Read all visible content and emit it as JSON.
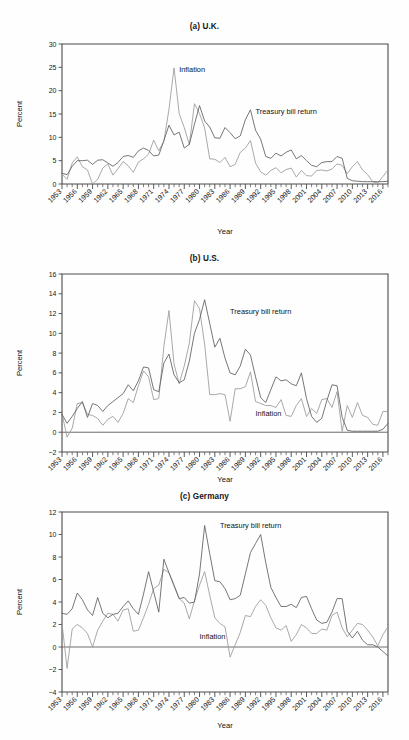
{
  "figure": {
    "axis_label_y": "Percent",
    "axis_label_x": "Year",
    "series_names": {
      "inflation": "Inflation",
      "tbill": "Treasury bill return"
    },
    "colors": {
      "inflation": "#9a9a9a",
      "tbill": "#5e5e5e",
      "axis": "#4a4a4a",
      "background": "#fefefe"
    }
  },
  "panels": [
    {
      "id": "uk",
      "title": "(a) U.K."
    },
    {
      "id": "us",
      "title": "(b) U.S."
    },
    {
      "id": "de",
      "title": "(c) Germany"
    }
  ],
  "chart_data": [
    {
      "type": "line",
      "title": "(a) U.K.",
      "xlabel": "Year",
      "ylabel": "Percent",
      "ylim": [
        0,
        30
      ],
      "yticks": [
        0,
        5,
        10,
        15,
        20,
        25,
        30
      ],
      "xlim": [
        1953,
        2017
      ],
      "xticks": [
        1953,
        1956,
        1959,
        1962,
        1965,
        1968,
        1971,
        1974,
        1977,
        1980,
        1983,
        1986,
        1989,
        1992,
        1995,
        1998,
        2001,
        2004,
        2007,
        2010,
        2013,
        2016
      ],
      "grid": false,
      "legend": "inline-annotations",
      "x": [
        1953,
        1954,
        1955,
        1956,
        1957,
        1958,
        1959,
        1960,
        1961,
        1962,
        1963,
        1964,
        1965,
        1966,
        1967,
        1968,
        1969,
        1970,
        1971,
        1972,
        1973,
        1974,
        1975,
        1976,
        1977,
        1978,
        1979,
        1980,
        1981,
        1982,
        1983,
        1984,
        1985,
        1986,
        1987,
        1988,
        1989,
        1990,
        1991,
        1992,
        1993,
        1994,
        1995,
        1996,
        1997,
        1998,
        1999,
        2000,
        2001,
        2002,
        2003,
        2004,
        2005,
        2006,
        2007,
        2008,
        2009,
        2010,
        2011,
        2012,
        2013,
        2014,
        2015,
        2016,
        2017
      ],
      "series": [
        {
          "name": "Inflation",
          "values": [
            2.1,
            1.0,
            4.5,
            5.8,
            3.7,
            3.0,
            0.0,
            1.0,
            3.4,
            4.3,
            1.9,
            3.3,
            4.8,
            3.9,
            2.5,
            4.7,
            5.4,
            6.4,
            9.4,
            7.1,
            9.2,
            16.0,
            24.9,
            15.1,
            12.1,
            8.4,
            17.2,
            15.1,
            12.0,
            5.4,
            5.3,
            4.6,
            5.7,
            3.7,
            4.2,
            6.8,
            7.7,
            9.3,
            4.5,
            2.6,
            1.9,
            2.9,
            3.5,
            2.4,
            3.1,
            3.4,
            1.5,
            2.9,
            1.8,
            1.7,
            2.9,
            3.0,
            2.8,
            3.2,
            4.3,
            4.0,
            2.2,
            3.7,
            4.8,
            3.0,
            2.0,
            0.5,
            0.2,
            1.6,
            3.0
          ],
          "color": "#9a9a9a"
        },
        {
          "name": "Treasury bill return",
          "values": [
            2.3,
            2.0,
            3.8,
            5.0,
            5.0,
            5.1,
            4.2,
            5.1,
            5.2,
            4.5,
            3.8,
            4.6,
            5.9,
            6.1,
            5.7,
            7.1,
            7.7,
            7.2,
            6.0,
            6.2,
            9.3,
            12.6,
            10.5,
            11.1,
            7.7,
            8.5,
            12.8,
            16.8,
            13.5,
            12.2,
            9.9,
            9.8,
            12.1,
            11.0,
            9.7,
            10.3,
            13.8,
            15.9,
            11.5,
            9.6,
            5.9,
            5.5,
            6.6,
            6.0,
            6.8,
            7.3,
            5.4,
            6.1,
            5.0,
            4.0,
            3.7,
            4.6,
            4.8,
            4.8,
            5.9,
            5.5,
            1.2,
            0.7,
            0.6,
            0.5,
            0.5,
            0.5,
            0.5,
            0.5,
            0.6
          ],
          "color": "#5e5e5e"
        }
      ],
      "annotations": [
        {
          "text": "Inflation",
          "x": 1976,
          "y": 24.0
        },
        {
          "text": "Treasury bill return",
          "x": 1991,
          "y": 15.0
        }
      ]
    },
    {
      "type": "line",
      "title": "(b) U.S.",
      "xlabel": "Year",
      "ylabel": "Percent",
      "ylim": [
        -2,
        16
      ],
      "yticks": [
        -2,
        0,
        2,
        4,
        6,
        8,
        10,
        12,
        14,
        16
      ],
      "xlim": [
        1953,
        2017
      ],
      "xticks": [
        1953,
        1956,
        1959,
        1962,
        1965,
        1968,
        1971,
        1974,
        1977,
        1980,
        1983,
        1986,
        1989,
        1992,
        1995,
        1998,
        2001,
        2004,
        2007,
        2010,
        2013,
        2016
      ],
      "grid": false,
      "legend": "inline-annotations",
      "x": [
        1953,
        1954,
        1955,
        1956,
        1957,
        1958,
        1959,
        1960,
        1961,
        1962,
        1963,
        1964,
        1965,
        1966,
        1967,
        1968,
        1969,
        1970,
        1971,
        1972,
        1973,
        1974,
        1975,
        1976,
        1977,
        1978,
        1979,
        1980,
        1981,
        1982,
        1983,
        1984,
        1985,
        1986,
        1987,
        1988,
        1989,
        1990,
        1991,
        1992,
        1993,
        1994,
        1995,
        1996,
        1997,
        1998,
        1999,
        2000,
        2001,
        2002,
        2003,
        2004,
        2005,
        2006,
        2007,
        2008,
        2009,
        2010,
        2011,
        2012,
        2013,
        2014,
        2015,
        2016,
        2017
      ],
      "series": [
        {
          "name": "Inflation",
          "values": [
            1.9,
            -0.5,
            0.4,
            2.9,
            3.0,
            1.8,
            1.7,
            1.4,
            0.7,
            1.3,
            1.6,
            1.0,
            1.9,
            3.4,
            3.0,
            4.7,
            6.2,
            5.6,
            3.3,
            3.4,
            8.7,
            12.3,
            6.9,
            4.9,
            6.7,
            9.0,
            13.3,
            12.5,
            8.9,
            3.8,
            3.8,
            3.9,
            3.8,
            1.1,
            4.4,
            4.4,
            4.6,
            6.1,
            3.1,
            2.9,
            2.7,
            2.7,
            2.5,
            3.3,
            1.7,
            1.6,
            2.7,
            3.4,
            1.6,
            2.4,
            1.9,
            3.3,
            3.4,
            2.5,
            4.1,
            0.1,
            2.7,
            1.5,
            3.0,
            1.7,
            1.5,
            0.8,
            0.7,
            2.1,
            2.1
          ],
          "color": "#9a9a9a"
        },
        {
          "name": "Treasury bill return",
          "values": [
            1.8,
            0.9,
            1.6,
            2.4,
            3.1,
            1.5,
            2.9,
            2.7,
            2.1,
            2.7,
            3.1,
            3.5,
            3.9,
            4.8,
            4.2,
            5.2,
            6.6,
            6.5,
            4.3,
            4.1,
            7.0,
            7.9,
            5.8,
            5.0,
            5.3,
            7.2,
            10.0,
            11.4,
            13.4,
            11.0,
            8.6,
            9.5,
            7.5,
            6.0,
            5.8,
            6.7,
            8.4,
            7.8,
            5.6,
            3.5,
            3.0,
            4.3,
            5.6,
            5.2,
            5.3,
            4.9,
            4.7,
            6.0,
            3.4,
            1.6,
            1.0,
            1.4,
            3.2,
            4.8,
            4.7,
            1.5,
            0.2,
            0.1,
            0.1,
            0.1,
            0.1,
            0.1,
            0.1,
            0.3,
            0.9
          ],
          "color": "#5e5e5e"
        }
      ],
      "annotations": [
        {
          "text": "Treasury bill return",
          "x": 1986,
          "y": 12.0
        },
        {
          "text": "Inflation",
          "x": 1991,
          "y": 1.6
        }
      ]
    },
    {
      "type": "line",
      "title": "(c) Germany",
      "xlabel": "Year",
      "ylabel": "Percent",
      "ylim": [
        -4,
        12
      ],
      "yticks": [
        -4,
        -2,
        0,
        2,
        4,
        6,
        8,
        10,
        12
      ],
      "xlim": [
        1953,
        2017
      ],
      "xticks": [
        1953,
        1956,
        1959,
        1962,
        1965,
        1968,
        1971,
        1974,
        1977,
        1980,
        1983,
        1986,
        1989,
        1992,
        1995,
        1998,
        2001,
        2004,
        2007,
        2010,
        2013,
        2016
      ],
      "grid": false,
      "legend": "inline-annotations",
      "x": [
        1953,
        1954,
        1955,
        1956,
        1957,
        1958,
        1959,
        1960,
        1961,
        1962,
        1963,
        1964,
        1965,
        1966,
        1967,
        1968,
        1969,
        1970,
        1971,
        1972,
        1973,
        1974,
        1975,
        1976,
        1977,
        1978,
        1979,
        1980,
        1981,
        1982,
        1983,
        1984,
        1985,
        1986,
        1987,
        1988,
        1989,
        1990,
        1991,
        1992,
        1993,
        1994,
        1995,
        1996,
        1997,
        1998,
        1999,
        2000,
        2001,
        2002,
        2003,
        2004,
        2005,
        2006,
        2007,
        2008,
        2009,
        2010,
        2011,
        2012,
        2013,
        2014,
        2015,
        2016,
        2017
      ],
      "series": [
        {
          "name": "Inflation",
          "values": [
            2.1,
            -1.9,
            1.6,
            2.0,
            1.7,
            1.2,
            0.0,
            1.5,
            2.3,
            3.0,
            2.9,
            2.3,
            3.3,
            3.4,
            1.4,
            1.5,
            2.6,
            3.8,
            5.2,
            5.5,
            6.9,
            6.6,
            5.4,
            4.3,
            3.9,
            2.5,
            4.1,
            5.5,
            6.7,
            4.6,
            2.6,
            2.1,
            1.8,
            -0.9,
            0.2,
            1.3,
            2.8,
            2.7,
            3.6,
            4.2,
            3.7,
            2.6,
            1.7,
            1.5,
            1.9,
            0.5,
            1.1,
            2.0,
            1.7,
            1.2,
            1.2,
            1.6,
            1.5,
            2.8,
            3.1,
            1.7,
            0.9,
            1.5,
            2.1,
            2.0,
            1.5,
            0.9,
            0.1,
            1.1,
            1.8
          ],
          "color": "#9a9a9a"
        },
        {
          "name": "Treasury bill return",
          "values": [
            3.0,
            2.9,
            3.4,
            4.8,
            4.2,
            3.3,
            2.8,
            4.4,
            3.0,
            2.6,
            2.9,
            3.0,
            3.6,
            4.1,
            3.4,
            2.9,
            4.7,
            6.7,
            4.9,
            3.1,
            7.8,
            6.6,
            5.5,
            4.3,
            4.4,
            3.9,
            4.0,
            6.5,
            10.8,
            8.3,
            5.9,
            5.8,
            5.2,
            4.2,
            4.3,
            4.6,
            6.5,
            8.4,
            9.2,
            10.0,
            7.5,
            5.3,
            4.4,
            3.6,
            3.6,
            3.8,
            3.5,
            4.4,
            4.5,
            3.4,
            2.4,
            2.1,
            2.2,
            3.1,
            4.3,
            4.3,
            1.4,
            0.8,
            1.4,
            0.6,
            0.2,
            0.2,
            0.0,
            -0.4,
            -0.8
          ],
          "color": "#5e5e5e"
        }
      ],
      "annotations": [
        {
          "text": "Treasury bill return",
          "x": 1984,
          "y": 10.6
        },
        {
          "text": "Inflation",
          "x": 1980,
          "y": 0.7
        }
      ]
    }
  ]
}
